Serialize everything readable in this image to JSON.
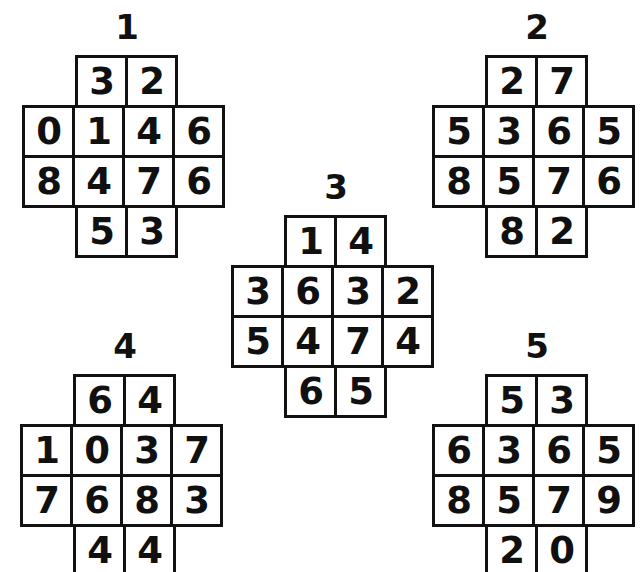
{
  "page": {
    "background_color": "#ffffff",
    "ink_color": "#111111",
    "width": 640,
    "height": 572
  },
  "puzzles": [
    {
      "label": "1",
      "name": "puzzle-1",
      "left": 22,
      "top": 8,
      "grid_top": 47,
      "clipped": "none",
      "rows": [
        {
          "indent": true,
          "cells": [
            "3",
            "2"
          ]
        },
        {
          "indent": false,
          "cells": [
            "0",
            "1",
            "4",
            "6"
          ]
        },
        {
          "indent": false,
          "cells": [
            "8",
            "4",
            "7",
            "6"
          ]
        },
        {
          "indent": true,
          "cells": [
            "5",
            "3"
          ]
        }
      ]
    },
    {
      "label": "2",
      "name": "puzzle-2",
      "left": 432,
      "top": 8,
      "grid_top": 47,
      "clipped": "right",
      "rows": [
        {
          "indent": true,
          "cells": [
            "2",
            "7"
          ]
        },
        {
          "indent": false,
          "cells": [
            "5",
            "3",
            "6",
            "5"
          ]
        },
        {
          "indent": false,
          "cells": [
            "8",
            "5",
            "7",
            "6"
          ]
        },
        {
          "indent": true,
          "cells": [
            "8",
            "2"
          ]
        }
      ]
    },
    {
      "label": "3",
      "name": "puzzle-3",
      "left": 231,
      "top": 168,
      "grid_top": 47,
      "clipped": "none",
      "rows": [
        {
          "indent": true,
          "cells": [
            "1",
            "4"
          ]
        },
        {
          "indent": false,
          "cells": [
            "3",
            "6",
            "3",
            "2"
          ]
        },
        {
          "indent": false,
          "cells": [
            "5",
            "4",
            "7",
            "4"
          ]
        },
        {
          "indent": true,
          "cells": [
            "6",
            "5"
          ]
        }
      ]
    },
    {
      "label": "4",
      "name": "puzzle-4",
      "left": 20,
      "top": 327,
      "grid_top": 47,
      "clipped": "bottom",
      "rows": [
        {
          "indent": true,
          "cells": [
            "6",
            "4"
          ]
        },
        {
          "indent": false,
          "cells": [
            "1",
            "0",
            "3",
            "7"
          ]
        },
        {
          "indent": false,
          "cells": [
            "7",
            "6",
            "8",
            "3"
          ]
        },
        {
          "indent": true,
          "cells": [
            "4",
            "4"
          ]
        }
      ]
    },
    {
      "label": "5",
      "name": "puzzle-5",
      "left": 432,
      "top": 327,
      "grid_top": 47,
      "clipped": "bottom-right",
      "rows": [
        {
          "indent": true,
          "cells": [
            "5",
            "3"
          ]
        },
        {
          "indent": false,
          "cells": [
            "6",
            "3",
            "6",
            "5"
          ]
        },
        {
          "indent": false,
          "cells": [
            "8",
            "5",
            "7",
            "9"
          ]
        },
        {
          "indent": true,
          "cells": [
            "2",
            "0"
          ]
        }
      ]
    }
  ]
}
